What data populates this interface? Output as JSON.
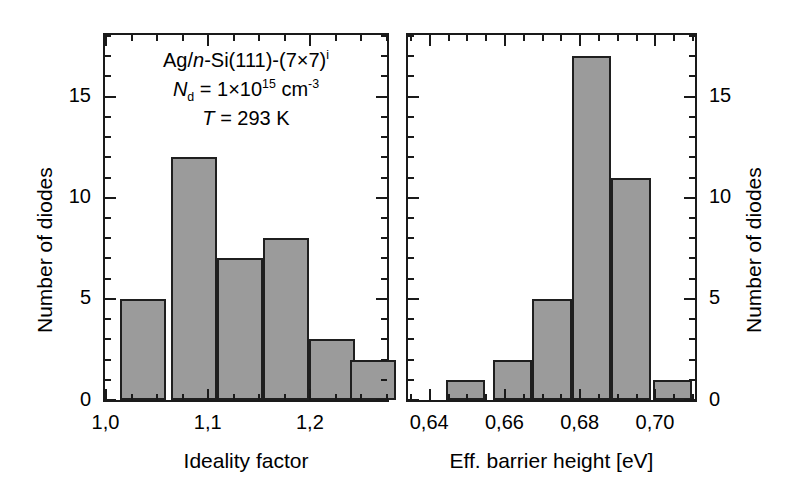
{
  "chart_data": [
    {
      "type": "bar",
      "panel": "left",
      "title": "",
      "xlabel": "Ideality factor",
      "ylabel": "Number of diodes",
      "xlim": [
        1.0,
        1.275
      ],
      "ylim": [
        0,
        18
      ],
      "xticks": [
        1.0,
        1.1,
        1.2
      ],
      "xtick_labels": [
        "1,0",
        "1,1",
        "1,2"
      ],
      "yticks": [
        0,
        5,
        10,
        15
      ],
      "ytick_labels": [
        "0",
        "5",
        "10",
        "15"
      ],
      "x_minor_step": 0.025,
      "y_minor_step": 1,
      "bin_width": 0.045,
      "bin_starts": [
        1.015,
        1.065,
        1.11,
        1.155,
        1.2,
        1.24
      ],
      "categories": [
        "1.02-1.06",
        "1.06-1.11",
        "1.11-1.15",
        "1.15-1.20",
        "1.20-1.24",
        "1.24-1.28"
      ],
      "values": [
        5,
        12,
        7,
        8,
        3,
        2
      ],
      "grid": false,
      "bar_fill": "#9b9b9b",
      "bar_edge": "#1f1f1f"
    },
    {
      "type": "bar",
      "panel": "right",
      "title": "",
      "xlabel": "Eff. barrier height [eV]",
      "ylabel": "Number of diodes",
      "xlim": [
        0.6345,
        0.7105
      ],
      "ylim": [
        0,
        18
      ],
      "xticks": [
        0.64,
        0.66,
        0.68,
        0.7
      ],
      "xtick_labels": [
        "0,64",
        "0,66",
        "0,68",
        "0,70"
      ],
      "yticks": [
        0,
        5,
        10,
        15
      ],
      "ytick_labels": [
        "0",
        "5",
        "10",
        "15"
      ],
      "x_minor_step": 0.005,
      "y_minor_step": 1,
      "bin_width": 0.0105,
      "bin_starts": [
        0.6445,
        0.657,
        0.6675,
        0.678,
        0.6885,
        0.6995
      ],
      "categories": [
        "0.645-0.655",
        "0.657-0.667",
        "0.668-0.678",
        "0.678-0.688",
        "0.689-0.699",
        "0.700-0.710"
      ],
      "values": [
        1,
        2,
        5,
        17,
        11,
        1
      ],
      "grid": false,
      "bar_fill": "#9b9b9b",
      "bar_edge": "#1f1f1f"
    }
  ],
  "annotation": {
    "line1_prefix": "Ag/",
    "line1_italic": "n",
    "line1_suffix": "-Si(111)-(7×7)",
    "line1_sup": "i",
    "line2_sym": "N",
    "line2_sub": "d",
    "line2_mid": " = 1×10",
    "line2_sup1": "15",
    "line2_unit": " cm",
    "line2_sup2": "-3",
    "line3_sym": "T",
    "line3_value": " = 293 K"
  },
  "colors": {
    "bar_fill": "#9b9b9b",
    "bar_edge": "#1f1f1f",
    "axis": "#1a1a1a",
    "text": "#000000",
    "background": "#ffffff"
  }
}
